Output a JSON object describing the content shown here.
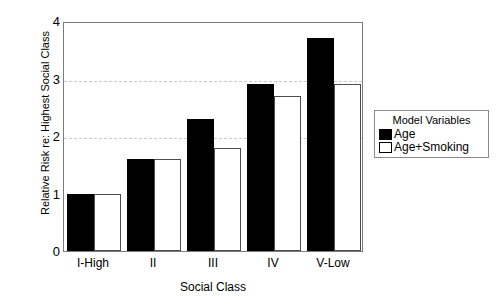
{
  "chart_data": {
    "type": "bar",
    "title": "",
    "xlabel": "Social Class",
    "ylabel": "Relative Risk re: Highest Social Class",
    "categories": [
      "I-High",
      "II",
      "III",
      "IV",
      "V-Low"
    ],
    "series": [
      {
        "name": "Age",
        "color": "#000000",
        "values": [
          1.0,
          1.6,
          2.3,
          2.9,
          3.7
        ]
      },
      {
        "name": "Age+Smoking",
        "color": "#ffffff",
        "values": [
          1.0,
          1.6,
          1.8,
          2.7,
          2.9
        ]
      }
    ],
    "ylim": [
      0,
      4
    ],
    "yticks": [
      "0",
      "1",
      "2",
      "3",
      "4"
    ],
    "ytick_values": [
      0,
      1,
      2,
      3,
      4
    ],
    "gridlines": [
      2,
      3
    ],
    "grid": true,
    "legend": {
      "title": "Model Variables",
      "position": "right",
      "entries": [
        {
          "label": "Age",
          "swatch": "black"
        },
        {
          "label": "Age+Smoking",
          "swatch": "white"
        }
      ]
    }
  }
}
